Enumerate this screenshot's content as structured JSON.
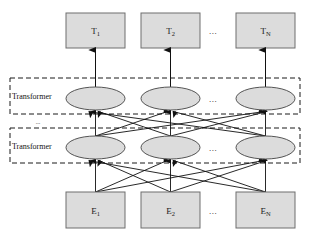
{
  "figure": {
    "type": "diagram",
    "width": 310,
    "height": 238,
    "background": "#ffffff"
  },
  "style": {
    "box_fill": "#dcdcdc",
    "box_stroke": "#6e6e6e",
    "ellipse_fill": "#dcdcdc",
    "ellipse_stroke": "#555555",
    "dashed_stroke": "#1a1a1a",
    "line_stroke": "#1a1a1a",
    "text_color": "#1a1a1a"
  },
  "output_layer": {
    "name": "output-token-boxes",
    "nodes": [
      {
        "id": "T1",
        "base": "T",
        "sub": "1",
        "cx": 95.5,
        "cy": 30.5
      },
      {
        "id": "T2",
        "base": "T",
        "sub": "2",
        "cx": 170.5,
        "cy": 30.5
      },
      {
        "id": "TN",
        "base": "T",
        "sub": "N",
        "cx": 265.5,
        "cy": 30.5
      }
    ],
    "ellipsis": {
      "text": "...",
      "cx": 213,
      "cy": 31
    },
    "box": {
      "width": 59,
      "height": 35,
      "top": 13
    }
  },
  "transformer_layers": [
    {
      "id": "transformer-upper",
      "label": "Transformer",
      "label_x": 12,
      "label_y": 96,
      "box": {
        "x": 10,
        "y": 78,
        "width": 290,
        "height": 36
      },
      "ellipsis": {
        "text": "...",
        "cx": 213,
        "cy": 99
      },
      "nodes": [
        {
          "id": "upper-1",
          "cx": 95.5,
          "cy": 98.5
        },
        {
          "id": "upper-2",
          "cx": 170.5,
          "cy": 98.5
        },
        {
          "id": "upper-3",
          "cx": 265.5,
          "cy": 98.5
        }
      ]
    },
    {
      "id": "transformer-lower",
      "label": "Transformer",
      "label_x": 12,
      "label_y": 146,
      "box": {
        "x": 10,
        "y": 128,
        "width": 290,
        "height": 35
      },
      "ellipsis": {
        "text": "...",
        "cx": 213,
        "cy": 148
      },
      "nodes": [
        {
          "id": "lower-1",
          "cx": 95.5,
          "cy": 147.5
        },
        {
          "id": "lower-2",
          "cx": 170.5,
          "cy": 147.5
        },
        {
          "id": "lower-3",
          "cx": 265.5,
          "cy": 147.5
        }
      ]
    }
  ],
  "stack_ellipsis": {
    "text": "...",
    "cx": 38,
    "cy": 122
  },
  "input_layer": {
    "name": "input-embedding-boxes",
    "nodes": [
      {
        "id": "E1",
        "base": "E",
        "sub": "1",
        "cx": 95.5,
        "cy": 210.5
      },
      {
        "id": "E2",
        "base": "E",
        "sub": "2",
        "cx": 170.5,
        "cy": 210.5
      },
      {
        "id": "EN",
        "base": "E",
        "sub": "N",
        "cx": 265.5,
        "cy": 210.5
      }
    ],
    "ellipsis": {
      "text": "...",
      "cx": 213,
      "cy": 211
    },
    "box": {
      "width": 59,
      "height": 36,
      "top": 192
    }
  },
  "ellipse_geometry": {
    "rx": 29.5,
    "ry": 11.5
  },
  "connections": {
    "output_arrows": {
      "name": "transformer-to-output-arrows",
      "from_y": 87,
      "to_y": 49,
      "columns": [
        95.5,
        170.5,
        265.5
      ]
    },
    "interlayer_full": {
      "name": "lower-to-upper-full-connections",
      "from_y": 136,
      "to_y": 110,
      "columns": [
        95.5,
        170.5,
        265.5
      ]
    },
    "input_full": {
      "name": "input-to-lower-full-connections",
      "from_y": 192,
      "to_y": 159,
      "columns": [
        95.5,
        170.5,
        265.5
      ]
    }
  }
}
